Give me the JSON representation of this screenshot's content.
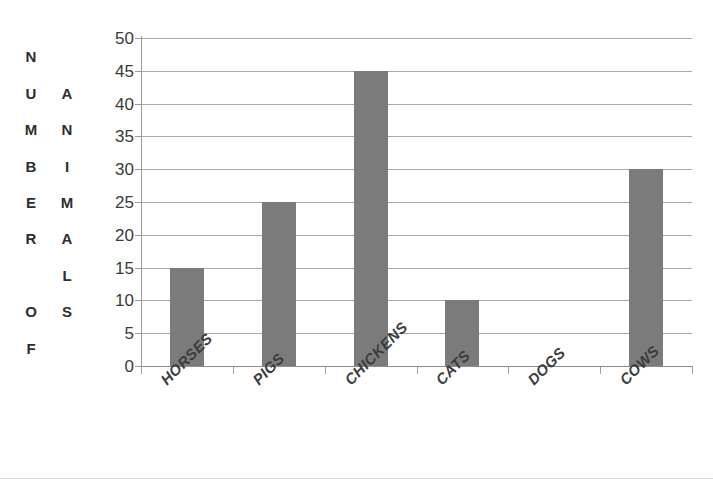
{
  "page": {
    "clipped_header_text": "",
    "background_color": "#ffffff"
  },
  "chart_data": {
    "type": "bar",
    "title": "",
    "subtitle": "",
    "categories": [
      "HORSES",
      "PIGS",
      "CHICKENS",
      "CATS",
      "DOGS",
      "COWS"
    ],
    "values": [
      15,
      25,
      45,
      10,
      0,
      30
    ],
    "series": [
      {
        "name": "Number of Animals",
        "values": [
          15,
          25,
          45,
          10,
          0,
          30
        ]
      }
    ],
    "xlabel": "",
    "ylabel": "NUMBER OF ANIMALS",
    "ylabel_column_1": "NUMBER OF",
    "ylabel_column_2": "ANIMALS",
    "ylabel_column_1_letters": [
      "N",
      "U",
      "M",
      "B",
      "E",
      "R",
      "",
      "O",
      "F"
    ],
    "ylabel_column_2_letters": [
      "",
      "A",
      "N",
      "I",
      "M",
      "A",
      "L",
      "S",
      ""
    ],
    "ylim": [
      0,
      50
    ],
    "ytick_values": [
      0,
      5,
      10,
      15,
      20,
      25,
      30,
      35,
      40,
      45,
      50
    ],
    "ytick_labels": [
      "0",
      "5",
      "10",
      "15",
      "20",
      "25",
      "30",
      "35",
      "40",
      "45",
      "50"
    ],
    "ytick_interval": 5,
    "grid": true,
    "grid_axis": "y",
    "legend": false,
    "legend_position": "none",
    "bar_color": "#7b7b7b",
    "gridline_color": "#a9a9a9",
    "axis_color": "#9a9a9a",
    "plot_background": "#ffffff",
    "category_label_rotation": -45,
    "annotations": []
  }
}
